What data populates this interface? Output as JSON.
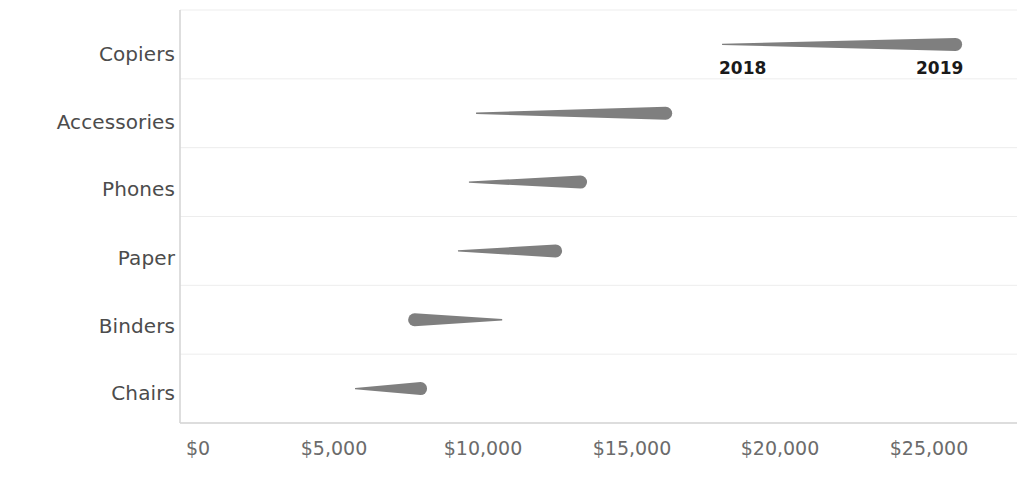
{
  "chart_data": {
    "type": "bar",
    "variant": "tapered-slope-arrows",
    "title": "",
    "xlabel": "",
    "ylabel": "",
    "xlim": [
      0,
      26500
    ],
    "ylim": null,
    "grid": true,
    "legend_position": "inline-top-right",
    "axis_color": "#d9d9d9",
    "arrow_color": "#7f7f7f",
    "categories": [
      "Copiers",
      "Accessories",
      "Phones",
      "Paper",
      "Binders",
      "Chairs"
    ],
    "series": [
      {
        "name": "2018",
        "values": [
          17660,
          9370,
          9130,
          8760,
          10250,
          5290
        ]
      },
      {
        "name": "2019",
        "values": [
          25750,
          15980,
          13110,
          12270,
          7080,
          7720
        ]
      }
    ],
    "points": [
      {
        "category": "Copiers",
        "start_label": "2018",
        "start_value": 17660,
        "end_label": "2019",
        "end_value": 25750,
        "direction": "increase"
      },
      {
        "category": "Accessories",
        "start_label": "2018",
        "start_value": 9370,
        "end_label": "2019",
        "end_value": 15980,
        "direction": "increase"
      },
      {
        "category": "Phones",
        "start_label": "2018",
        "start_value": 9130,
        "end_label": "2019",
        "end_value": 13110,
        "direction": "increase"
      },
      {
        "category": "Paper",
        "start_label": "2018",
        "start_value": 8760,
        "end_label": "2019",
        "end_value": 12270,
        "direction": "increase"
      },
      {
        "category": "Binders",
        "start_label": "2018",
        "start_value": 10250,
        "end_label": "2019",
        "end_value": 7080,
        "direction": "decrease"
      },
      {
        "category": "Chairs",
        "start_label": "2018",
        "start_value": 5290,
        "end_label": "2019",
        "end_value": 7720,
        "direction": "increase"
      }
    ],
    "xticks": [
      0,
      5000,
      10000,
      15000,
      20000,
      25000
    ],
    "xticklabels": [
      "$0",
      "$5,000",
      "$10,000",
      "$15,000",
      "$20,000",
      "$25,000"
    ],
    "annotations": [
      {
        "name": "year-start",
        "text": "2018"
      },
      {
        "name": "year-end",
        "text": "2019"
      }
    ]
  },
  "axis": {
    "y_labels": [
      "Copiers",
      "Accessories",
      "Phones",
      "Paper",
      "Binders",
      "Chairs"
    ],
    "x_labels": [
      "$0",
      "$5,000",
      "$10,000",
      "$15,000",
      "$20,000",
      "$25,000"
    ]
  },
  "legend": {
    "start_year": "2018",
    "end_year": "2019"
  },
  "colors": {
    "arrow": "#7f7f7f",
    "gridline": "#ededed",
    "axis": "#d6d6d6",
    "category_text": "#4c4c4c",
    "tick_text": "#6b6b6b",
    "annotation_text": "#1a1a1a"
  }
}
